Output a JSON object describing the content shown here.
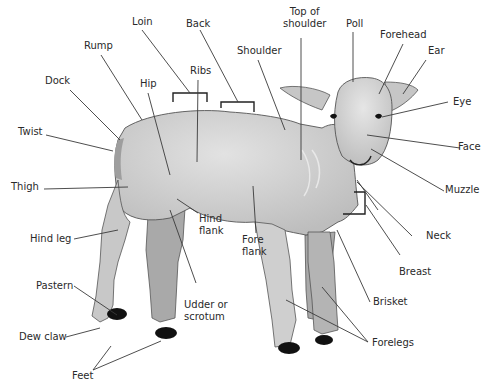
{
  "diagram": {
    "colors": {
      "wool": "#c8c8c8",
      "wool_light": "#dcdcdc",
      "leg_shadow": "#a9a9a9",
      "hoof": "#111111",
      "outline": "#555555",
      "leader": "#3a3a3a",
      "text": "#2a2a2a"
    },
    "labels": [
      {
        "id": "loin",
        "text": "Loin"
      },
      {
        "id": "back",
        "text": "Back"
      },
      {
        "id": "top-of-shoulder",
        "line1": "Top of",
        "line2": "shoulder"
      },
      {
        "id": "poll",
        "text": "Poll"
      },
      {
        "id": "forehead",
        "text": "Forehead"
      },
      {
        "id": "ear",
        "text": "Ear"
      },
      {
        "id": "rump",
        "text": "Rump"
      },
      {
        "id": "shoulder",
        "text": "Shoulder"
      },
      {
        "id": "ribs",
        "text": "Ribs"
      },
      {
        "id": "dock",
        "text": "Dock"
      },
      {
        "id": "hip",
        "text": "Hip"
      },
      {
        "id": "eye",
        "text": "Eye"
      },
      {
        "id": "twist",
        "text": "Twist"
      },
      {
        "id": "face",
        "text": "Face"
      },
      {
        "id": "thigh",
        "text": "Thigh"
      },
      {
        "id": "muzzle",
        "text": "Muzzle"
      },
      {
        "id": "hind-flank",
        "line1": "Hind",
        "line2": "flank"
      },
      {
        "id": "neck",
        "text": "Neck"
      },
      {
        "id": "hind-leg",
        "text": "Hind leg"
      },
      {
        "id": "fore-flank",
        "line1": "Fore",
        "line2": "flank"
      },
      {
        "id": "breast",
        "text": "Breast"
      },
      {
        "id": "pastern",
        "text": "Pastern"
      },
      {
        "id": "udder-or-scrotum",
        "line1": "Udder or",
        "line2": "scrotum"
      },
      {
        "id": "brisket",
        "text": "Brisket"
      },
      {
        "id": "dew-claw",
        "text": "Dew claw"
      },
      {
        "id": "forelegs",
        "text": "Forelegs"
      },
      {
        "id": "feet",
        "text": "Feet"
      }
    ]
  }
}
